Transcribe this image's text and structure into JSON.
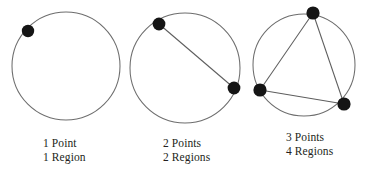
{
  "figure": {
    "background_color": "#ffffff",
    "stroke_color": "#6d6d6d",
    "dot_color": "#151515",
    "text_color": "#231f20",
    "width": 369,
    "height": 172
  },
  "panels": [
    {
      "id": "panel-1",
      "circle": {
        "cx": 66,
        "cy": 66,
        "r": 54
      },
      "points": [
        {
          "id": "p1",
          "cx": 28,
          "cy": 31,
          "r": 6.2
        }
      ],
      "chords": [],
      "caption_line_1": "1 Point",
      "caption_line_2": "1 Region",
      "point_count": 1,
      "region_count": 1
    },
    {
      "id": "panel-2",
      "circle": {
        "cx": 185,
        "cy": 68,
        "r": 55
      },
      "points": [
        {
          "id": "p1",
          "cx": 159,
          "cy": 24,
          "r": 6.4
        },
        {
          "id": "p2",
          "cx": 234,
          "cy": 88,
          "r": 6.4
        }
      ],
      "chords": [
        {
          "x1": 159,
          "y1": 24,
          "x2": 234,
          "y2": 88
        }
      ],
      "caption_line_1": "2 Points",
      "caption_line_2": "2 Regions",
      "point_count": 2,
      "region_count": 2
    },
    {
      "id": "panel-3",
      "circle": {
        "cx": 304,
        "cy": 65,
        "r": 51
      },
      "points": [
        {
          "id": "p1",
          "cx": 313,
          "cy": 13,
          "r": 6.6
        },
        {
          "id": "p2",
          "cx": 260,
          "cy": 90,
          "r": 6.6
        },
        {
          "id": "p3",
          "cx": 344,
          "cy": 104,
          "r": 6.6
        }
      ],
      "chords": [
        {
          "x1": 313,
          "y1": 13,
          "x2": 260,
          "y2": 90
        },
        {
          "x1": 313,
          "y1": 13,
          "x2": 344,
          "y2": 104
        },
        {
          "x1": 260,
          "y1": 90,
          "x2": 344,
          "y2": 104
        }
      ],
      "caption_line_1": "3 Points",
      "caption_line_2": "4 Regions",
      "point_count": 3,
      "region_count": 4
    }
  ],
  "chart_data": {
    "type": "scatter",
    "xlabel": "Points",
    "ylabel": "Regions",
    "categories": [
      "1 Point",
      "2 Points",
      "3 Points"
    ],
    "x": [
      1,
      2,
      3
    ],
    "values": [
      1,
      2,
      4
    ],
    "series": [
      {
        "name": "Regions",
        "values": [
          1,
          2,
          4
        ]
      }
    ],
    "annotations": [
      "1 Point / 1 Region",
      "2 Points / 2 Regions",
      "3 Points / 4 Regions"
    ]
  }
}
